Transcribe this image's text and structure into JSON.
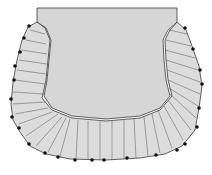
{
  "figure": {
    "colors": {
      "fabric": "#d9d9d9",
      "outline": "#3a3a3a",
      "pin": "#111111",
      "background": "#ffffff"
    },
    "pins": [
      [
        29,
        26
      ],
      [
        24,
        38
      ],
      [
        20,
        52
      ],
      [
        15,
        66
      ],
      [
        14,
        80
      ],
      [
        11,
        99
      ],
      [
        12,
        117
      ],
      [
        19,
        128
      ],
      [
        29,
        144
      ],
      [
        45,
        153
      ],
      [
        58,
        157
      ],
      [
        75,
        160
      ],
      [
        92,
        160
      ],
      [
        104,
        160
      ],
      [
        127,
        158
      ],
      [
        156,
        155
      ],
      [
        177,
        150
      ],
      [
        185,
        144
      ],
      [
        197,
        127
      ],
      [
        199,
        108
      ],
      [
        202,
        84
      ],
      [
        200,
        70
      ],
      [
        193,
        49
      ],
      [
        185,
        28
      ]
    ],
    "caption": ""
  }
}
